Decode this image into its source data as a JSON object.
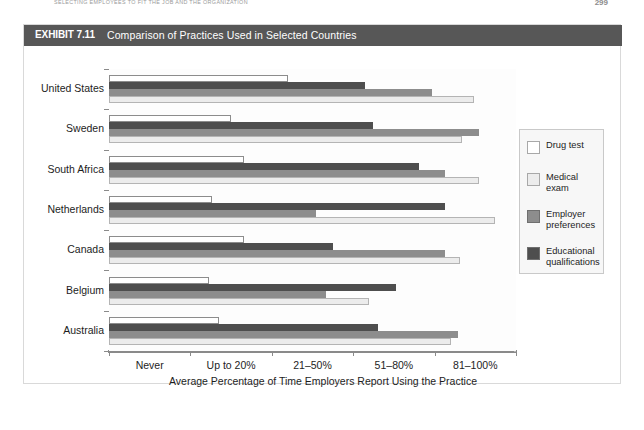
{
  "running_head": {
    "text": "SELECTING EMPLOYEES TO FIT THE JOB AND THE ORGANIZATION",
    "page_number": "299"
  },
  "exhibit": {
    "label": "EXHIBIT 7.11",
    "title": "Comparison of Practices Used in Selected Countries"
  },
  "legend": {
    "items": [
      {
        "label": "Drug test",
        "color": "#ffffff"
      },
      {
        "label": "Medical exam",
        "color": "#ececec"
      },
      {
        "label": "Employer preferences",
        "color": "#8d8d8d"
      },
      {
        "label": "Educational qualifications",
        "color": "#4e4e4e"
      }
    ]
  },
  "chart_data": {
    "type": "bar",
    "orientation": "horizontal",
    "title": "Comparison of Practices Used in Selected Countries",
    "xlabel": "Average Percentage of Time Employers Report Using the Practice",
    "ylabel": "",
    "grid": false,
    "legend_position": "right",
    "xticklabels": [
      "Never",
      "Up to 20%",
      "21–50%",
      "51–80%",
      "81–100%"
    ],
    "xlim": [
      0,
      5
    ],
    "categories": [
      "United States",
      "Sweden",
      "South Africa",
      "Netherlands",
      "Canada",
      "Belgium",
      "Australia"
    ],
    "series": [
      {
        "name": "Drug test",
        "color": "#ffffff",
        "values": [
          2.2,
          1.5,
          1.66,
          1.27,
          1.66,
          1.23,
          1.35
        ]
      },
      {
        "name": "Medical exam",
        "color": "#ececec",
        "values": [
          4.49,
          4.34,
          4.55,
          4.74,
          4.31,
          3.2,
          4.2
        ]
      },
      {
        "name": "Employer preferences",
        "color": "#8d8d8d",
        "values": [
          3.97,
          4.55,
          4.13,
          2.54,
          4.13,
          2.66,
          4.29
        ]
      },
      {
        "name": "Educational qualifications",
        "color": "#4e4e4e",
        "values": [
          3.15,
          3.24,
          3.81,
          4.13,
          2.75,
          3.53,
          3.31
        ]
      }
    ]
  }
}
